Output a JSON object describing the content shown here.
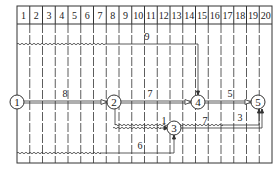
{
  "diagram": {
    "type": "time-scaled network diagram",
    "grid": {
      "columns": 20,
      "x0": 17,
      "x1": 272,
      "header_top": 6,
      "header_bottom": 24,
      "bottom": 163
    },
    "time_units": [
      "1",
      "2",
      "3",
      "4",
      "5",
      "6",
      "7",
      "8",
      "9",
      "10",
      "11",
      "12",
      "13",
      "14",
      "15",
      "16",
      "17",
      "18",
      "19",
      "20"
    ],
    "nodes": [
      {
        "id": "1",
        "label": "1",
        "x": 17,
        "y": 102
      },
      {
        "id": "2",
        "label": "2",
        "x": 114,
        "y": 102
      },
      {
        "id": "4",
        "label": "4",
        "x": 198,
        "y": 102
      },
      {
        "id": "5",
        "label": "5",
        "x": 258,
        "y": 102
      },
      {
        "id": "3",
        "label": "3",
        "x": 174,
        "y": 127
      }
    ],
    "activities": [
      {
        "label": "8",
        "from": "1",
        "to": "2"
      },
      {
        "label": "7",
        "from": "2",
        "to": "4"
      },
      {
        "label": "5",
        "from": "4",
        "to": "5"
      },
      {
        "label": "9",
        "from": "1",
        "to": "4"
      },
      {
        "label": "3",
        "from": "2",
        "to": "5"
      },
      {
        "label": "1",
        "from": "2",
        "to": "3"
      },
      {
        "label": "7",
        "from": "3",
        "to": "5"
      },
      {
        "label": "6",
        "from": "1",
        "to": "3"
      }
    ]
  }
}
